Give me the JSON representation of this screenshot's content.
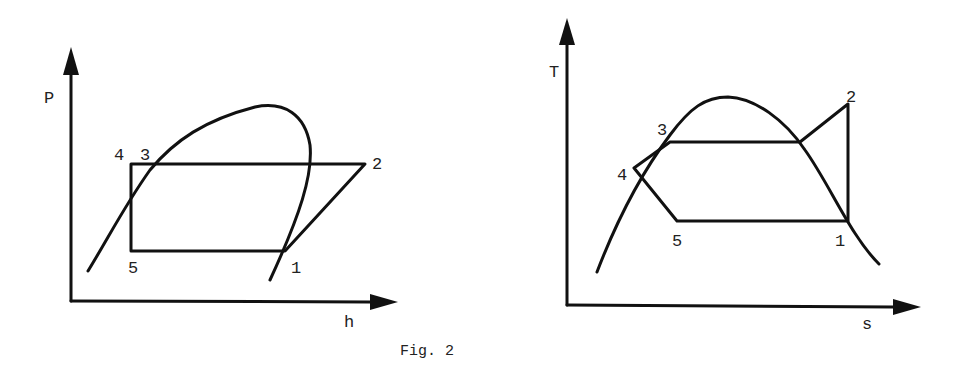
{
  "figure": {
    "caption": "Fig. 2"
  },
  "diagrams": [
    {
      "name": "P-h diagram",
      "x_axis_label": "h",
      "y_axis_label": "P",
      "points": [
        {
          "label": "1"
        },
        {
          "label": "2"
        },
        {
          "label": "3"
        },
        {
          "label": "4"
        },
        {
          "label": "5"
        }
      ]
    },
    {
      "name": "T-s diagram",
      "x_axis_label": "s",
      "y_axis_label": "T",
      "points": [
        {
          "label": "1"
        },
        {
          "label": "2"
        },
        {
          "label": "3"
        },
        {
          "label": "4"
        },
        {
          "label": "5"
        }
      ]
    }
  ]
}
